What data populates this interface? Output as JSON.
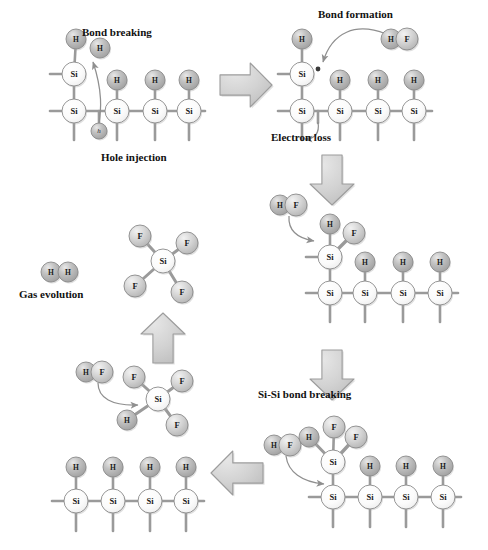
{
  "figure": {
    "background_color": "#ffffff"
  },
  "colors": {
    "atom_h_fill": "#b9b9b9",
    "atom_f_fill": "#cfcfcf",
    "atom_si_fill": "#fdfdfd",
    "atom_stroke": "#8a8a8a",
    "bond_color": "#9a9a9a",
    "block_arrow_fill": "#d4d4d4",
    "block_arrow_stroke": "#9c9c9c",
    "curve_arrow_color": "#8f8f8f",
    "label_color": "#111111"
  },
  "labels": [
    {
      "id": "bond-breaking",
      "text": "Bond breaking",
      "x": 82,
      "y": 36,
      "anchor": "start"
    },
    {
      "id": "hole-injection",
      "text": "Hole injection",
      "x": 101,
      "y": 161,
      "anchor": "start"
    },
    {
      "id": "bond-formation",
      "text": "Bond formation",
      "x": 318,
      "y": 18,
      "anchor": "start"
    },
    {
      "id": "electron-loss",
      "text": "Electron loss",
      "x": 271,
      "y": 141,
      "anchor": "start"
    },
    {
      "id": "si-si-bond-breaking",
      "text": "Si-Si bond breaking",
      "x": 258,
      "y": 398,
      "anchor": "start"
    },
    {
      "id": "gas-evolution",
      "text": "Gas evolution",
      "x": 19,
      "y": 298,
      "anchor": "start"
    }
  ],
  "block_arrows": [
    {
      "id": "arrow-step1-to-step2",
      "direction": "right",
      "cx": 246,
      "cy": 85,
      "w": 52,
      "h": 44
    },
    {
      "id": "arrow-step2-to-step3",
      "direction": "down",
      "cx": 332,
      "cy": 180,
      "w": 44,
      "h": 50
    },
    {
      "id": "arrow-step3-to-step4",
      "direction": "down",
      "cx": 332,
      "cy": 375,
      "w": 44,
      "h": 50
    },
    {
      "id": "arrow-step4-to-step5",
      "direction": "left",
      "cx": 237,
      "cy": 473,
      "w": 52,
      "h": 44
    },
    {
      "id": "arrow-step5-to-step6",
      "direction": "up",
      "cx": 163,
      "cy": 338,
      "w": 44,
      "h": 50
    }
  ],
  "panels": [
    {
      "id": "panel-step1-bond-breaking",
      "name": "hole-injection-bond-breaking",
      "atoms": [
        {
          "el": "H",
          "x": 76,
          "y": 39,
          "r": 10
        },
        {
          "el": "H",
          "x": 100,
          "y": 48,
          "r": 10
        },
        {
          "el": "Si",
          "x": 74,
          "y": 74,
          "r": 12
        },
        {
          "el": "Si",
          "x": 74,
          "y": 111,
          "r": 12
        },
        {
          "el": "H",
          "x": 117,
          "y": 80,
          "r": 10
        },
        {
          "el": "Si",
          "x": 117,
          "y": 111,
          "r": 12
        },
        {
          "el": "H",
          "x": 155,
          "y": 80,
          "r": 10
        },
        {
          "el": "Si",
          "x": 155,
          "y": 111,
          "r": 12
        },
        {
          "el": "H",
          "x": 189,
          "y": 80,
          "r": 10
        },
        {
          "el": "Si",
          "x": 189,
          "y": 111,
          "r": 12
        },
        {
          "el": "h",
          "x": 99,
          "y": 131,
          "r": 8
        }
      ]
    },
    {
      "id": "panel-step2-bond-formation",
      "name": "bond-formation-electron-loss",
      "atoms": [
        {
          "el": "H",
          "x": 302,
          "y": 39,
          "r": 10
        },
        {
          "el": "Si",
          "x": 302,
          "y": 74,
          "r": 12
        },
        {
          "el": "Si",
          "x": 302,
          "y": 111,
          "r": 12
        },
        {
          "el": "H",
          "x": 340,
          "y": 80,
          "r": 10
        },
        {
          "el": "Si",
          "x": 340,
          "y": 111,
          "r": 12
        },
        {
          "el": "H",
          "x": 378,
          "y": 80,
          "r": 10
        },
        {
          "el": "Si",
          "x": 378,
          "y": 111,
          "r": 12
        },
        {
          "el": "H",
          "x": 414,
          "y": 80,
          "r": 10
        },
        {
          "el": "Si",
          "x": 414,
          "y": 111,
          "r": 12
        },
        {
          "el": "H",
          "x": 391,
          "y": 39,
          "r": 10
        },
        {
          "el": "F",
          "x": 407,
          "y": 39,
          "r": 11
        }
      ]
    },
    {
      "id": "panel-step3-hf-attack",
      "name": "hf-addition-to-dangling-bond",
      "atoms": [
        {
          "el": "H",
          "x": 280,
          "y": 205,
          "r": 10
        },
        {
          "el": "F",
          "x": 296,
          "y": 205,
          "r": 11
        },
        {
          "el": "H",
          "x": 330,
          "y": 224,
          "r": 10
        },
        {
          "el": "F",
          "x": 354,
          "y": 233,
          "r": 11
        },
        {
          "el": "Si",
          "x": 330,
          "y": 257,
          "r": 12
        },
        {
          "el": "Si",
          "x": 330,
          "y": 293,
          "r": 12
        },
        {
          "el": "H",
          "x": 365,
          "y": 262,
          "r": 10
        },
        {
          "el": "Si",
          "x": 365,
          "y": 293,
          "r": 12
        },
        {
          "el": "H",
          "x": 403,
          "y": 262,
          "r": 10
        },
        {
          "el": "Si",
          "x": 403,
          "y": 293,
          "r": 12
        },
        {
          "el": "H",
          "x": 440,
          "y": 262,
          "r": 10
        },
        {
          "el": "Si",
          "x": 440,
          "y": 293,
          "r": 12
        }
      ]
    },
    {
      "id": "panel-step4-sisi-breaking",
      "name": "si-si-bond-breaking",
      "atoms": [
        {
          "el": "H",
          "x": 274,
          "y": 445,
          "r": 10
        },
        {
          "el": "F",
          "x": 290,
          "y": 445,
          "r": 11
        },
        {
          "el": "F",
          "x": 334,
          "y": 427,
          "r": 11
        },
        {
          "el": "H",
          "x": 309,
          "y": 437,
          "r": 10
        },
        {
          "el": "F",
          "x": 356,
          "y": 437,
          "r": 11
        },
        {
          "el": "Si",
          "x": 333,
          "y": 462,
          "r": 12
        },
        {
          "el": "Si",
          "x": 333,
          "y": 497,
          "r": 12
        },
        {
          "el": "H",
          "x": 370,
          "y": 466,
          "r": 10
        },
        {
          "el": "Si",
          "x": 370,
          "y": 497,
          "r": 12
        },
        {
          "el": "H",
          "x": 406,
          "y": 466,
          "r": 10
        },
        {
          "el": "Si",
          "x": 406,
          "y": 497,
          "r": 12
        },
        {
          "el": "H",
          "x": 443,
          "y": 466,
          "r": 10
        },
        {
          "el": "Si",
          "x": 443,
          "y": 497,
          "r": 12
        }
      ]
    },
    {
      "id": "panel-step5-regenerated-surface",
      "name": "regenerated-hydrogenated-surface",
      "atoms": [
        {
          "el": "H",
          "x": 76,
          "y": 467,
          "r": 10
        },
        {
          "el": "Si",
          "x": 76,
          "y": 501,
          "r": 12
        },
        {
          "el": "H",
          "x": 113,
          "y": 467,
          "r": 10
        },
        {
          "el": "Si",
          "x": 113,
          "y": 501,
          "r": 12
        },
        {
          "el": "H",
          "x": 150,
          "y": 467,
          "r": 10
        },
        {
          "el": "Si",
          "x": 150,
          "y": 501,
          "r": 12
        },
        {
          "el": "H",
          "x": 186,
          "y": 467,
          "r": 10
        },
        {
          "el": "Si",
          "x": 186,
          "y": 501,
          "r": 12
        }
      ]
    },
    {
      "id": "panel-step6-sif3h",
      "name": "sif3h-intermediate-with-hf",
      "atoms": [
        {
          "el": "H",
          "x": 86,
          "y": 372,
          "r": 10
        },
        {
          "el": "F",
          "x": 102,
          "y": 372,
          "r": 11
        },
        {
          "el": "F",
          "x": 134,
          "y": 377,
          "r": 11
        },
        {
          "el": "F",
          "x": 182,
          "y": 381,
          "r": 11
        },
        {
          "el": "Si",
          "x": 158,
          "y": 399,
          "r": 12
        },
        {
          "el": "H",
          "x": 127,
          "y": 420,
          "r": 10
        },
        {
          "el": "F",
          "x": 177,
          "y": 425,
          "r": 11
        }
      ]
    },
    {
      "id": "panel-step7-sif4",
      "name": "sif4-product-molecule",
      "atoms": [
        {
          "el": "F",
          "x": 140,
          "y": 236,
          "r": 11
        },
        {
          "el": "F",
          "x": 187,
          "y": 243,
          "r": 11
        },
        {
          "el": "Si",
          "x": 163,
          "y": 261,
          "r": 12
        },
        {
          "el": "F",
          "x": 135,
          "y": 286,
          "r": 11
        },
        {
          "el": "F",
          "x": 182,
          "y": 292,
          "r": 11
        }
      ]
    },
    {
      "id": "panel-step8-h2",
      "name": "hydrogen-gas-molecule",
      "atoms": [
        {
          "el": "H",
          "x": 51,
          "y": 272,
          "r": 10
        },
        {
          "el": "H",
          "x": 68,
          "y": 272,
          "r": 10
        }
      ]
    }
  ],
  "species": {
    "H": "hydrogen",
    "F": "fluorine",
    "Si": "silicon",
    "h": "hole"
  }
}
